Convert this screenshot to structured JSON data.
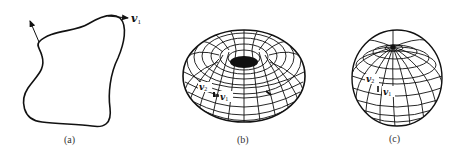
{
  "figure": {
    "panels": [
      {
        "id": "a",
        "caption": "(a)",
        "description": "closed planar curve with tangent vector",
        "labels": [
          {
            "base": "v",
            "sub": "1"
          }
        ]
      },
      {
        "id": "b",
        "caption": "(b)",
        "description": "torus with coordinate grid",
        "labels": [
          {
            "base": "v",
            "sub": "2"
          },
          {
            "base": "v",
            "sub": "1"
          }
        ]
      },
      {
        "id": "c",
        "caption": "(c)",
        "description": "sphere with coordinate grid",
        "labels": [
          {
            "base": "v",
            "sub": "2"
          },
          {
            "base": "v",
            "sub": "1"
          }
        ]
      }
    ]
  }
}
